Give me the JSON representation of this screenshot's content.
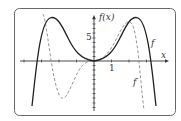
{
  "diagram": {
    "type": "function-graph",
    "y_axis_label": "f(x)",
    "x_axis_label": "x",
    "x_tick_label": "1",
    "y_tick_label": "5",
    "curves": [
      {
        "name": "f",
        "label": "f",
        "style": "solid",
        "color": "#222222"
      },
      {
        "name": "f-prime",
        "label": "f′",
        "style": "dashed",
        "color": "#888888"
      }
    ],
    "colors": {
      "frame": "#555555",
      "axis": "#333333",
      "background": "#ffffff"
    }
  }
}
